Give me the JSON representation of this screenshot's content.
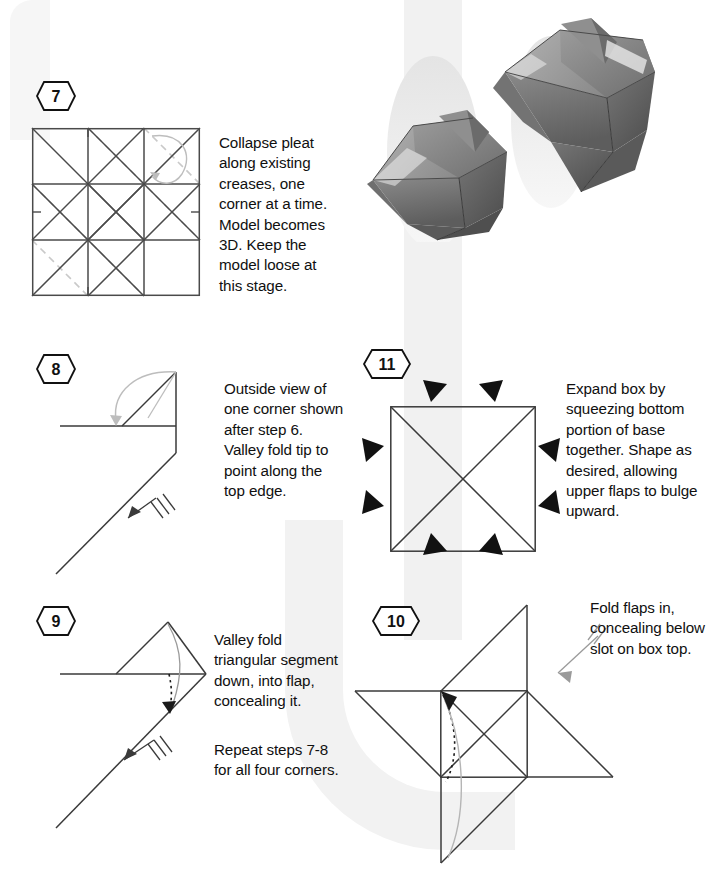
{
  "document": {
    "type": "origami-instruction-sheet",
    "title": "Origami Box Folding Instructions (steps 7-11)"
  },
  "photos": {
    "caption": "two finished folded paper boxes",
    "items": [
      {
        "name": "finished-box-upper-right"
      },
      {
        "name": "finished-box-lower-left"
      }
    ]
  },
  "steps": [
    {
      "id": "step-7",
      "number": "7",
      "text": "Collapse pleat along existing creases, one corner at a time. Model becomes 3D. Keep the model loose at this stage.",
      "diagram": "crease-pattern-square-grid"
    },
    {
      "id": "step-8",
      "number": "8",
      "text": "Outside view of one corner shown after step 6. Valley fold tip to point along the top edge.",
      "diagram": "corner-valley-fold"
    },
    {
      "id": "step-9",
      "number": "9",
      "text": "Valley fold triangular segment down, into flap, concealing it.",
      "text2": "Repeat steps 7-8 for all four corners.",
      "diagram": "corner-triangle-tuck"
    },
    {
      "id": "step-10",
      "number": "10",
      "text": "Fold flaps in, concealing below slot on box top.",
      "diagram": "pinwheel-flaps"
    },
    {
      "id": "step-11",
      "number": "11",
      "text": "Expand box by squeezing bottom portion of base together. Shape as desired, allowing upper flaps to bulge upward.",
      "diagram": "square-with-x-and-inward-arrows"
    }
  ],
  "colors": {
    "ink": "#111111",
    "crease_solid": "#4a4a4a",
    "crease_dashed": "#c9c9c9",
    "motion_arrow": "#9a9a9a",
    "watermark": "#f1f1f1",
    "paper": "#ffffff"
  }
}
